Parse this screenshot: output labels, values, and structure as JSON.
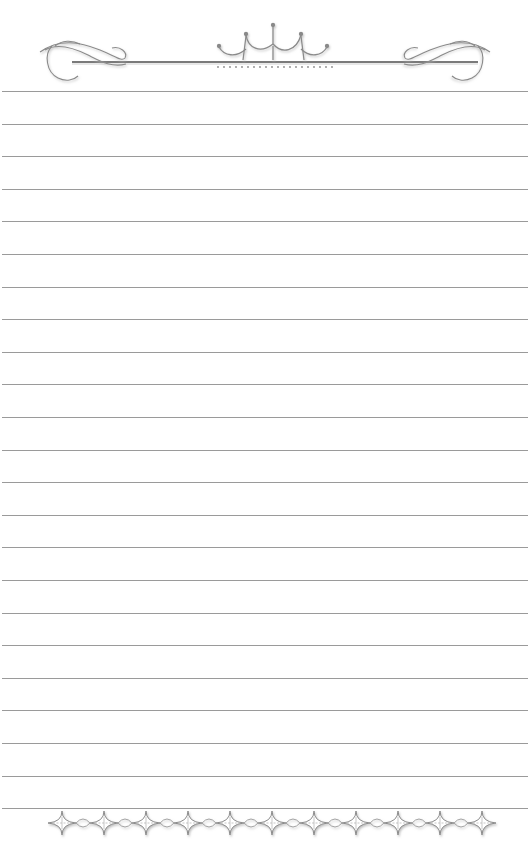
{
  "page": {
    "type": "decorative lined stationery",
    "background_color": "#ffffff",
    "line_color": "#9a9a9a",
    "ornament_color": "#8c8c8c",
    "ornament_shadow": "#c8c8c8"
  },
  "header": {
    "ornament": "flourish-crown-divider",
    "elements": [
      "left-scroll-flourish",
      "center-crown-arches",
      "right-scroll-flourish",
      "dotted-fringe"
    ]
  },
  "lines": {
    "count": 23,
    "first_y": 91,
    "spacing": 32.6
  },
  "footer": {
    "ornament": "diamond-chain-border",
    "diamond_count": 11
  }
}
